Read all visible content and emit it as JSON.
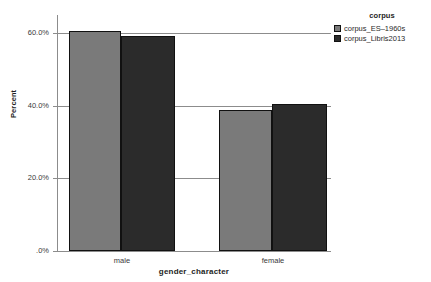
{
  "chart_data": {
    "type": "bar",
    "title": "",
    "subtitle": "",
    "xlabel": "gender_character",
    "ylabel": "Percent",
    "categories": [
      "male",
      "female"
    ],
    "series": [
      {
        "name": "corpus_ES–1960s",
        "color": "#7a7a7a",
        "values": [
          60.6,
          38.8
        ]
      },
      {
        "name": "corpus_Libris2013",
        "color": "#2b2b2b",
        "values": [
          59.3,
          40.5
        ]
      }
    ],
    "ylim": [
      0,
      65
    ],
    "yticks": [
      0,
      20,
      40,
      60
    ],
    "ytick_labels": [
      ".0%",
      "20.0%",
      "40.0%",
      "60.0%"
    ],
    "grid": "horizontal",
    "legend_position": "top-right",
    "legend_title": "corpus"
  },
  "axes": {
    "y_title": "Percent",
    "x_title": "gender_character",
    "y_ticks": [
      {
        "value": 60,
        "label": "60.0%"
      },
      {
        "value": 40,
        "label": "40.0%"
      },
      {
        "value": 20,
        "label": "20.0%"
      },
      {
        "value": 0,
        "label": ".0%"
      }
    ],
    "x_categories": [
      {
        "label": "male"
      },
      {
        "label": "female"
      }
    ]
  },
  "legend": {
    "title": "corpus",
    "items": [
      {
        "label": "corpus_ES–1960s",
        "color": "#7a7a7a"
      },
      {
        "label": "corpus_Libris2013",
        "color": "#2b2b2b"
      }
    ]
  },
  "bars": [
    {
      "group": "male",
      "series": "corpus_ES–1960s",
      "value": 60.6,
      "color": "#7a7a7a",
      "left": 12,
      "width": 52
    },
    {
      "group": "male",
      "series": "corpus_Libris2013",
      "value": 59.3,
      "color": "#2b2b2b",
      "left": 64,
      "width": 54
    },
    {
      "group": "female",
      "series": "corpus_ES–1960s",
      "value": 38.8,
      "color": "#7a7a7a",
      "left": 162,
      "width": 53
    },
    {
      "group": "female",
      "series": "corpus_Libris2013",
      "value": 40.5,
      "color": "#2b2b2b",
      "left": 215,
      "width": 55
    }
  ],
  "colors": {
    "series_1": "#7a7a7a",
    "series_2": "#2b2b2b",
    "axis": "#8c8c8c",
    "gridline": "#8c8c8c",
    "bar_outline": "#111111",
    "background": "#ffffff"
  }
}
